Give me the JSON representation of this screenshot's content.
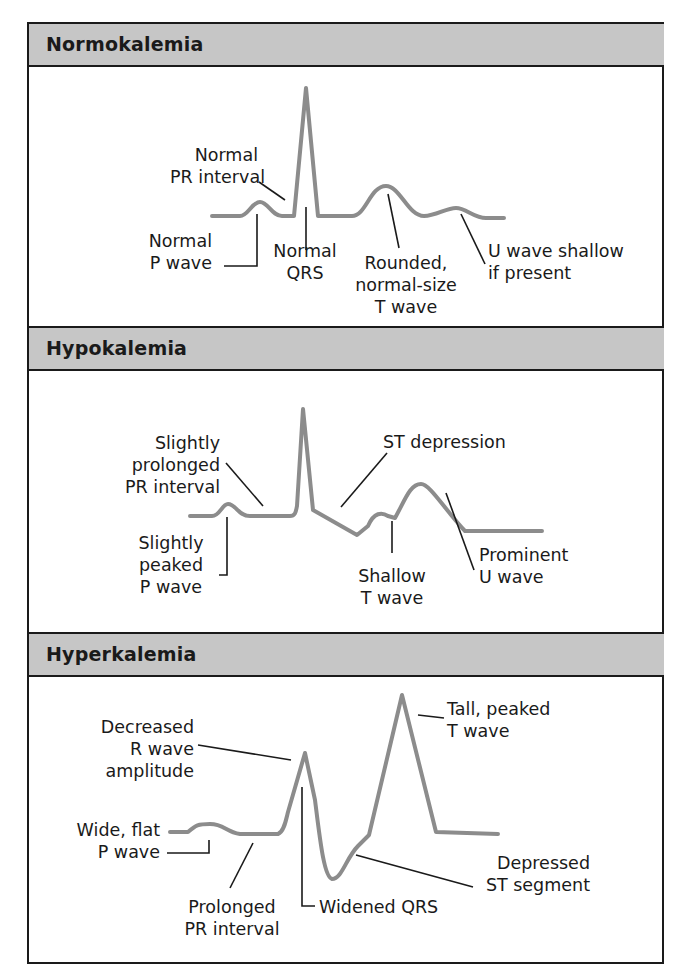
{
  "panels": [
    {
      "title": "Normokalemia",
      "labels": {
        "pr": [
          "Normal",
          "PR interval"
        ],
        "p": [
          "Normal",
          "P wave"
        ],
        "qrs": [
          "Normal",
          "QRS"
        ],
        "t": [
          "Rounded,",
          "normal-size",
          "T wave"
        ],
        "u": [
          "U wave shallow",
          "if present"
        ]
      }
    },
    {
      "title": "Hypokalemia",
      "labels": {
        "pr": [
          "Slightly",
          "prolonged",
          "PR interval"
        ],
        "p": [
          "Slightly",
          "peaked",
          "P wave"
        ],
        "st": [
          "ST depression"
        ],
        "t": [
          "Shallow",
          "T wave"
        ],
        "u": [
          "Prominent",
          "U wave"
        ]
      }
    },
    {
      "title": "Hyperkalemia",
      "labels": {
        "r": [
          "Decreased",
          "R wave",
          "amplitude"
        ],
        "p": [
          "Wide, flat",
          "P wave"
        ],
        "pr": [
          "Prolonged",
          "PR interval"
        ],
        "qrs": [
          "Widened QRS"
        ],
        "st": [
          "Depressed",
          "ST segment"
        ],
        "t": [
          "Tall, peaked",
          "T wave"
        ]
      }
    }
  ],
  "colors": {
    "header_bg": "#c6c6c6",
    "border": "#1a1a1a",
    "trace": "#8a8a8a",
    "leader": "#1a1a1a"
  }
}
